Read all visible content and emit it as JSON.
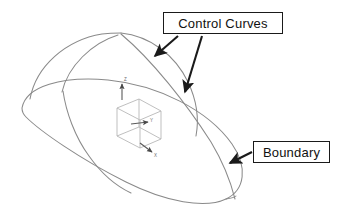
{
  "diagram": {
    "background_color": "#ffffff",
    "curve_color": "#8a8a8a",
    "label_color": "#111111",
    "label_border_color": "#1a1a1a",
    "arrow_color": "#1a1a1a",
    "triad_color": "#b0b0b0"
  },
  "callouts": [
    {
      "id": "control-curves",
      "label": "Control Curves",
      "points_to": [
        "upper-dome-arc",
        "sweeping-control-curve"
      ]
    },
    {
      "id": "boundary",
      "label": "Boundary",
      "points_to": [
        "boundary-ellipse"
      ]
    }
  ],
  "axes": {
    "x_label": "X",
    "y_label": "Y",
    "z_label": "Z"
  },
  "geometry": {
    "boundary_ellipse": "large tilted ellipse forming the surface outline",
    "control_curve_1": "left dome arc from boundary left to apex",
    "control_curve_2": "right dome arc from apex to boundary right",
    "control_curve_3": "sweeping curve from apex down past boundary to lower tip"
  }
}
